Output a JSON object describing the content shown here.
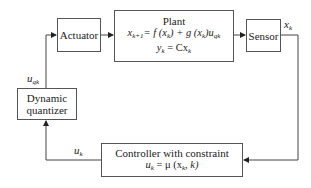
{
  "diagram": {
    "type": "block-diagram",
    "blocks": {
      "actuator": {
        "label": "Actuator"
      },
      "plant": {
        "title": "Plant",
        "eq1": {
          "lhs": "x",
          "lhs_sub": "k+1",
          "rhs": "= f (x",
          "rhs_sub1": "k",
          "mid": ") + g (x",
          "mid_sub": "k",
          "tail": ")u",
          "tail_sub": "qk"
        },
        "eq2": {
          "lhs": "y",
          "lhs_sub": "k",
          "rhs": " = Cx",
          "rhs_sub": "k"
        }
      },
      "sensor": {
        "label": "Sensor"
      },
      "quantizer": {
        "line1": "Dynamic",
        "line2": "quantizer"
      },
      "controller": {
        "title": "Controller with constraint",
        "eq": {
          "lhs": "u",
          "lhs_sub": "k",
          "mid": " = μ (x",
          "mid_sub": "k",
          "tail": ", k)"
        }
      }
    },
    "signals": {
      "xk": {
        "base": "x",
        "sub": "k"
      },
      "uqk": {
        "base": "u",
        "sub": "qk"
      },
      "uk": {
        "base": "u",
        "sub": "k"
      }
    },
    "edges": [
      {
        "from": "actuator",
        "to": "plant"
      },
      {
        "from": "plant",
        "to": "sensor"
      },
      {
        "from": "sensor",
        "to": "controller",
        "signal": "x_k"
      },
      {
        "from": "controller",
        "to": "quantizer",
        "signal": "u_k"
      },
      {
        "from": "quantizer",
        "to": "actuator",
        "signal": "u_qk"
      }
    ]
  }
}
